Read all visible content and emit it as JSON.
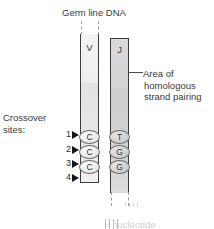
{
  "figure": {
    "title": "Germ line DNA",
    "left_label_line1": "Crossover",
    "left_label_line2": "sites:",
    "annotation": {
      "line1": "Area of",
      "line2": "homologous",
      "line3": "strand pairing"
    },
    "bottom_caption": "= nucleotide"
  },
  "segments": [
    {
      "name": "V",
      "letter": "V",
      "fill": "#e9e9e9",
      "outline": "#3c3c3c",
      "dashed_end": "top",
      "nucleotides": [
        "C",
        "C",
        "C"
      ]
    },
    {
      "name": "J",
      "letter": "J",
      "fill": "#d2d2d2",
      "outline": "#3c3c3c",
      "dashed_end": "bottom",
      "nucleotides": [
        "T",
        "G",
        "G"
      ]
    }
  ],
  "crossover_sites": [
    {
      "number": "1"
    },
    {
      "number": "2"
    },
    {
      "number": "3"
    },
    {
      "number": "4"
    }
  ],
  "icons": {
    "arrow": "triangle-right-icon",
    "leader": "leader-line-icon"
  },
  "colors": {
    "text": "#3a3a3a",
    "arrow": "#151515",
    "v_fill": "#e9e9e9",
    "j_fill": "#d2d2d2",
    "outline": "#3c3c3c",
    "dash": "#9a9a9a",
    "background": "#ffffff"
  }
}
